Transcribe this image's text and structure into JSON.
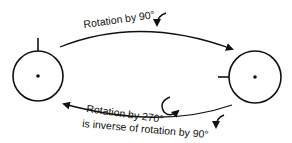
{
  "diagram": {
    "labels": {
      "top_arrow": "Rotation by 90°",
      "bottom_arrow_line1": "Rotation by 270°",
      "bottom_arrow_line2": "is inverse of rotation by 90°"
    },
    "nodes": [
      {
        "id": "left-state",
        "marker": "top"
      },
      {
        "id": "right-state",
        "marker": "left"
      }
    ],
    "colors": {
      "stroke": "#111111",
      "background": "#ffffff"
    }
  }
}
